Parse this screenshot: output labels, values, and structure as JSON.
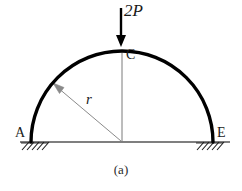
{
  "figure": {
    "caption": "(a)",
    "background_color": "#ffffff",
    "width": 242,
    "height": 191,
    "labels": {
      "load": "2P",
      "crown": "C",
      "radius": "r",
      "left_support": "A",
      "right_support": "E"
    },
    "colors": {
      "arch_stroke": "#000000",
      "ground_stroke": "#000000",
      "hatch_stroke": "#1a1a1a",
      "load_arrow": "#000000",
      "center_line": "#7a7a7a",
      "radius_line": "#8a8a8a",
      "text": "#1a1a1a"
    },
    "geometry": {
      "center_x": 122,
      "center_y": 142,
      "radius_px": 91,
      "ground_y": 142,
      "ground_x_start": 20,
      "ground_x_end": 230,
      "arch_left_x": 31,
      "arch_right_x": 213,
      "apex_y": 51,
      "load_arrow_top_y": 8,
      "load_arrow_tip_y": 46,
      "load_arrow_x": 121,
      "radius_arrow_tip_x": 54,
      "radius_arrow_tip_y": 84
    },
    "elements": {
      "arch": "semicircular-arch",
      "load": "point-load-at-crown",
      "supports": "fixed-hatched-supports",
      "radius_dimension": "radius-arrow"
    }
  }
}
